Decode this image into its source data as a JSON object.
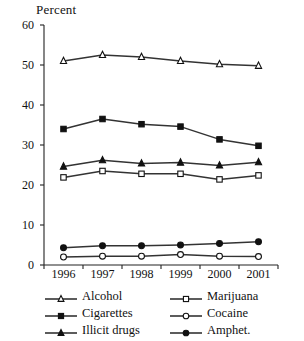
{
  "chart_data": {
    "type": "line",
    "title": "",
    "ylabel": "Percent",
    "xlabel": "",
    "categories": [
      "1996",
      "1997",
      "1998",
      "1999",
      "2000",
      "2001"
    ],
    "ylim": [
      0,
      60
    ],
    "yticks": [
      "0",
      "10",
      "20",
      "30",
      "40",
      "50",
      "60"
    ],
    "grid": false,
    "legend_position": "below-axis-two-columns",
    "series": [
      {
        "name": "Alcohol",
        "marker": "open-triangle",
        "values": [
          51.0,
          52.5,
          52.0,
          51.0,
          50.2,
          49.8
        ]
      },
      {
        "name": "Cigarettes",
        "marker": "filled-square",
        "values": [
          34.0,
          36.5,
          35.2,
          34.6,
          31.4,
          29.8
        ]
      },
      {
        "name": "Illicit drugs",
        "marker": "filled-triangle",
        "values": [
          24.6,
          26.2,
          25.4,
          25.6,
          24.9,
          25.7
        ]
      },
      {
        "name": "Marijuana",
        "marker": "open-square",
        "values": [
          21.9,
          23.5,
          22.8,
          22.8,
          21.4,
          22.4
        ]
      },
      {
        "name": "Cocaine",
        "marker": "open-circle",
        "values": [
          2.0,
          2.2,
          2.2,
          2.6,
          2.2,
          2.1
        ]
      },
      {
        "name": "Amphet.",
        "marker": "filled-circle",
        "values": [
          4.3,
          4.8,
          4.8,
          5.0,
          5.4,
          5.8
        ]
      }
    ],
    "line_color": "#333333",
    "axis_color": "#222222"
  },
  "legend": {
    "rows": [
      {
        "left": "Alcohol",
        "right": "Marijuana"
      },
      {
        "left": "Cigarettes",
        "right": "Cocaine"
      },
      {
        "left": "Illicit drugs",
        "right": "Amphet."
      }
    ]
  }
}
